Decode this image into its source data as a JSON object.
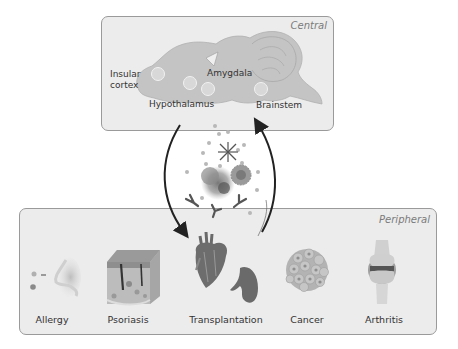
{
  "central": {
    "title": "Central",
    "regions": [
      {
        "label": "Insular\ncortex",
        "line1": "Insular",
        "line2": "cortex"
      },
      {
        "label": "Amygdala"
      },
      {
        "label": "Hypothalamus"
      },
      {
        "label": "Brainstem"
      }
    ]
  },
  "peripheral": {
    "title": "Peripheral",
    "conditions": [
      {
        "label": "Allergy",
        "icon": "nose-allergen-icon"
      },
      {
        "label": "Psoriasis",
        "icon": "skin-cross-section-icon"
      },
      {
        "label": "Transplantation",
        "icon": "heart-kidney-icon"
      },
      {
        "label": "Cancer",
        "icon": "tumor-cell-cluster-icon"
      },
      {
        "label": "Arthritis",
        "icon": "knee-joint-icon"
      }
    ]
  },
  "center": {
    "elements": [
      "downward-arrow",
      "upward-arrow",
      "cytokine-dots",
      "immune-cells",
      "antibodies",
      "snowflake-molecule"
    ]
  },
  "colors": {
    "box_fill": "#ececec",
    "box_border": "#9a9a9a",
    "organ_fill": "#c4c4c4",
    "label_italic": "#7a7a7a",
    "arrow": "#2a2a2a"
  }
}
